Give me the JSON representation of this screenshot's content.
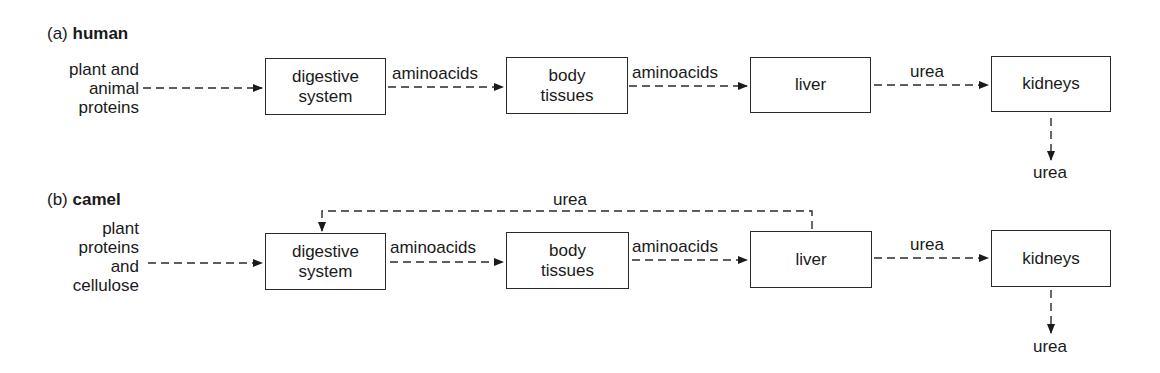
{
  "diagram": {
    "sections": [
      {
        "id": "a",
        "prefix": "(a)",
        "title": "human",
        "source_lines": [
          "plant and",
          "animal",
          "proteins"
        ],
        "boxes": [
          "digestive system",
          "body tissues",
          "liver",
          "kidneys"
        ],
        "box_lines": {
          "digestive": [
            "digestive",
            "system"
          ],
          "body": [
            "body",
            "tissues"
          ],
          "liver": "liver",
          "kidneys": "kidneys"
        },
        "edge_labels": {
          "digestive_to_body": "aminoacids",
          "body_to_liver": "aminoacids",
          "liver_to_kidneys": "urea",
          "kidneys_out": "urea"
        }
      },
      {
        "id": "b",
        "prefix": "(b)",
        "title": "camel",
        "source_lines": [
          "plant",
          "proteins",
          "and",
          "cellulose"
        ],
        "boxes": [
          "digestive system",
          "body tissues",
          "liver",
          "kidneys"
        ],
        "box_lines": {
          "digestive": [
            "digestive",
            "system"
          ],
          "body": [
            "body",
            "tissues"
          ],
          "liver": "liver",
          "kidneys": "kidneys"
        },
        "edge_labels": {
          "liver_to_digestive_feedback": "urea",
          "digestive_to_body": "aminoacids",
          "body_to_liver": "aminoacids",
          "liver_to_kidneys": "urea",
          "kidneys_out": "urea"
        }
      }
    ],
    "colors": {
      "ink": "#1a1a1a",
      "background": "#ffffff"
    }
  }
}
